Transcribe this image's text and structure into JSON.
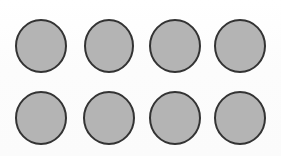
{
  "canvas": {
    "width": 281,
    "height": 156,
    "background_color": "#fdfdfd",
    "description": "Eight gray filled circles arranged in a 2 by 4 grid on a white background"
  },
  "style": {
    "circle_fill_color": "#b4b4b4",
    "circle_stroke_color": "#333333",
    "circle_stroke_width": 2,
    "background_color": "#fdfdfd"
  },
  "grid": {
    "rows": 2,
    "columns": 4,
    "total_shapes": 8,
    "shape_type": "circle",
    "row_center_y": [
      46,
      118
    ],
    "column_center_x": [
      41,
      109,
      175,
      240
    ]
  },
  "shapes": [
    {
      "id": "circle-1",
      "label": "circle-row-1-col-1",
      "cx": 41,
      "cy": 46,
      "rx": 25,
      "ry": 26
    },
    {
      "id": "circle-2",
      "label": "circle-row-1-col-2",
      "cx": 109,
      "cy": 46,
      "rx": 24,
      "ry": 26
    },
    {
      "id": "circle-3",
      "label": "circle-row-1-col-3",
      "cx": 175,
      "cy": 46,
      "rx": 25,
      "ry": 26
    },
    {
      "id": "circle-4",
      "label": "circle-row-1-col-4",
      "cx": 240,
      "cy": 46,
      "rx": 25,
      "ry": 26
    },
    {
      "id": "circle-5",
      "label": "circle-row-2-col-1",
      "cx": 41,
      "cy": 118,
      "rx": 25,
      "ry": 26
    },
    {
      "id": "circle-6",
      "label": "circle-row-2-col-2",
      "cx": 109,
      "cy": 118,
      "rx": 25,
      "ry": 26
    },
    {
      "id": "circle-7",
      "label": "circle-row-2-col-3",
      "cx": 175,
      "cy": 118,
      "rx": 25,
      "ry": 26
    },
    {
      "id": "circle-8",
      "label": "circle-row-2-col-4",
      "cx": 240,
      "cy": 118,
      "rx": 25,
      "ry": 26
    }
  ]
}
